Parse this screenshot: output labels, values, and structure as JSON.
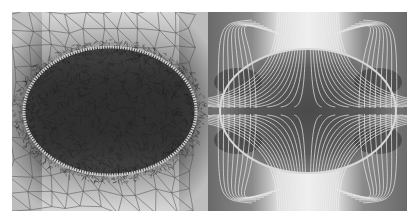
{
  "figure": {
    "panels": [
      {
        "id": "mesh",
        "description": "Adaptive triangular finite-element mesh refined around an elliptical inclusion",
        "colormap": "grayscale"
      },
      {
        "id": "field",
        "description": "Field/streamlines around an elliptical inclusion over grayscale intensity map",
        "colormap": "grayscale"
      }
    ],
    "colors": {
      "background": "#ffffff",
      "light_region": "#d8d8d8",
      "dark_region": "#3a3a3a",
      "mesh_lines": "#555555",
      "field_lines": "#e8e8e8",
      "ellipse_edge": "#cfcfcf"
    },
    "ellipse": {
      "rx_frac": 0.43,
      "ry_frac": 0.32
    }
  }
}
